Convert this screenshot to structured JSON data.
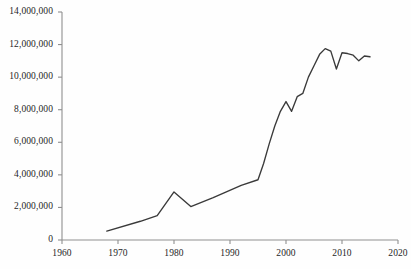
{
  "chart_data": {
    "type": "line",
    "title": "",
    "subtitle": "",
    "xlabel": "",
    "ylabel": "",
    "xlim": [
      1960,
      2020
    ],
    "ylim": [
      0,
      14000000
    ],
    "grid": false,
    "legend": "none",
    "xticks": [
      1960,
      1970,
      1980,
      1990,
      2000,
      2010,
      2020
    ],
    "xtick_labels": [
      "1960",
      "1970",
      "1980",
      "1990",
      "2000",
      "2010",
      "2020"
    ],
    "yticks": [
      0,
      2000000,
      4000000,
      6000000,
      8000000,
      10000000,
      12000000,
      14000000
    ],
    "ytick_labels": [
      "0",
      "2,000,000",
      "4,000,000",
      "6,000,000",
      "8,000,000",
      "10,000,000",
      "12,000,000",
      "14,000,000"
    ],
    "series": [
      {
        "name": "series-1",
        "color": "#3a3a3a",
        "x": [
          1968,
          1974,
          1977,
          1980,
          1983,
          1987,
          1992,
          1995,
          1996,
          1997,
          1998,
          1999,
          2000,
          2001,
          2002,
          2003,
          2004,
          2005,
          2006,
          2007,
          2008,
          2009,
          2010,
          2011,
          2012,
          2013,
          2014,
          2015
        ],
        "values": [
          550000,
          1150000,
          1500000,
          2950000,
          2050000,
          2600000,
          3350000,
          3700000,
          4700000,
          5900000,
          7000000,
          7900000,
          8500000,
          7900000,
          8800000,
          9000000,
          10000000,
          10700000,
          11400000,
          11750000,
          11600000,
          10500000,
          11500000,
          11450000,
          11350000,
          11000000,
          11300000,
          11250000
        ]
      }
    ]
  },
  "axes": {
    "y_axis_name": "y-axis",
    "x_axis_name": "x-axis",
    "axis_color": "#8a8a8a"
  }
}
